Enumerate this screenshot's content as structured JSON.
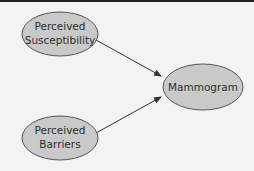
{
  "diagram": {
    "type": "path-model",
    "colors": {
      "background": "#f3f3f1",
      "node_fill": "#c9c9c9",
      "node_stroke": "#555555",
      "edge": "#333333",
      "text": "#2e2e2e",
      "top_border": "#1e1e1e"
    },
    "nodes": [
      {
        "id": "susceptibility",
        "line1": "Perceived",
        "line2": "Susceptibility"
      },
      {
        "id": "barriers",
        "line1": "Perceived",
        "line2": "Barriers"
      },
      {
        "id": "mammogram",
        "label": "Mammogram"
      }
    ],
    "edges": [
      {
        "from": "susceptibility",
        "to": "mammogram"
      },
      {
        "from": "barriers",
        "to": "mammogram"
      }
    ]
  }
}
